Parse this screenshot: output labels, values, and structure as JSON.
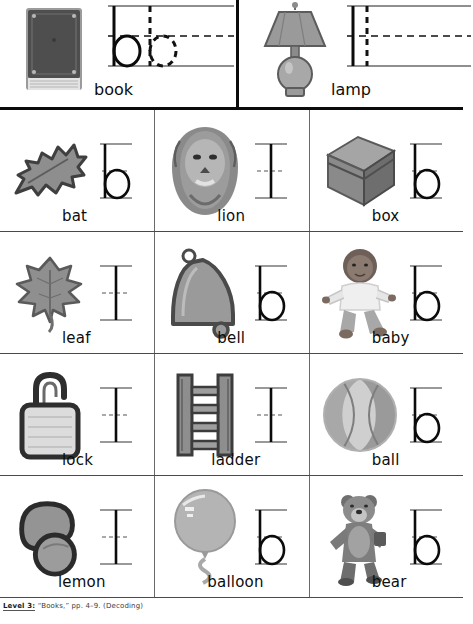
{
  "page": {
    "caption_bold": "Level 3:",
    "caption_rest": "“Books,” pp. 4–9. (Decoding)"
  },
  "header": {
    "cells": [
      {
        "word": "book",
        "picture": "book-picture",
        "guide": "trace",
        "has_letter": true
      },
      {
        "word": "lamp",
        "picture": "lamp-picture",
        "guide": "blank",
        "has_letter": false
      }
    ]
  },
  "grid": {
    "rows": [
      [
        {
          "word": "bat",
          "picture": "bat-picture",
          "has_letter": true
        },
        {
          "word": "lion",
          "picture": "lion-picture",
          "has_letter": false
        },
        {
          "word": "box",
          "picture": "box-picture",
          "has_letter": true
        }
      ],
      [
        {
          "word": "leaf",
          "picture": "leaf-picture",
          "has_letter": false
        },
        {
          "word": "bell",
          "picture": "bell-picture",
          "has_letter": true
        },
        {
          "word": "baby",
          "picture": "baby-picture",
          "has_letter": true
        }
      ],
      [
        {
          "word": "lock",
          "picture": "lock-picture",
          "has_letter": false
        },
        {
          "word": "ladder",
          "picture": "ladder-picture",
          "has_letter": false
        },
        {
          "word": "ball",
          "picture": "ball-picture",
          "has_letter": true
        }
      ],
      [
        {
          "word": "lemon",
          "picture": "lemon-picture",
          "has_letter": false
        },
        {
          "word": "balloon",
          "picture": "balloon-picture",
          "has_letter": true
        },
        {
          "word": "bear",
          "picture": "bear-picture",
          "has_letter": true
        }
      ]
    ]
  },
  "colors": {
    "ink": "#0b0b0b",
    "rule_line": "#4a4a4a",
    "divider": "#6a6a6a",
    "picture_mid": "#8d8d8d",
    "picture_dark": "#4a4a4a",
    "picture_light": "#c9c9c9",
    "paper": "#ffffff"
  }
}
